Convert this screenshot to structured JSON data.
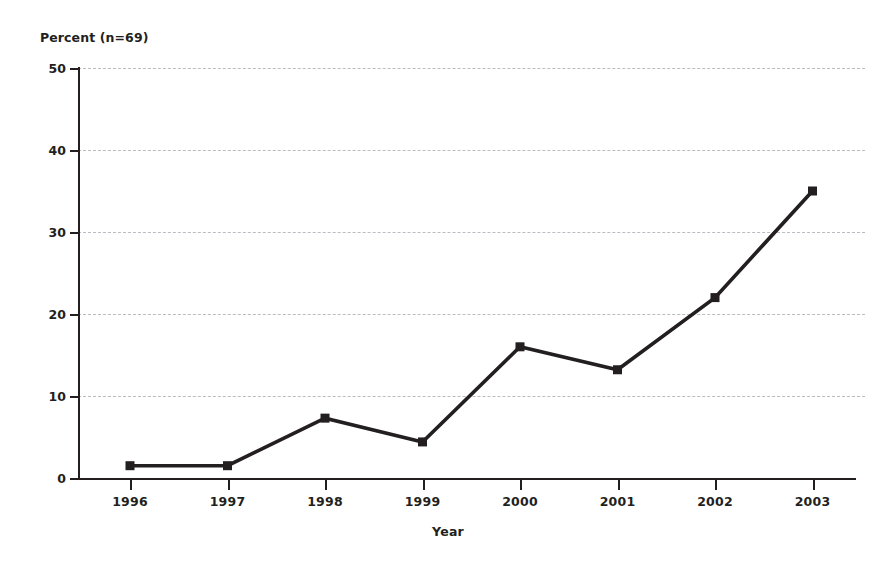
{
  "chart_data": {
    "type": "line",
    "title": "",
    "ylabel": "Percent (n=69)",
    "xlabel": "Year",
    "categories": [
      "1996",
      "1997",
      "1998",
      "1999",
      "2000",
      "2001",
      "2002",
      "2003"
    ],
    "values": [
      1.5,
      1.5,
      7.3,
      4.4,
      16,
      13.2,
      22,
      35
    ],
    "series": [
      {
        "name": "Percent",
        "values": [
          1.5,
          1.5,
          7.3,
          4.4,
          16,
          13.2,
          22,
          35
        ]
      }
    ],
    "ylim": [
      0,
      50
    ],
    "ytick_labels": [
      "0",
      "10",
      "20",
      "30",
      "40",
      "50"
    ],
    "ytick_values": [
      0,
      10,
      20,
      30,
      40,
      50
    ],
    "xtick_labels": [
      "1996",
      "1997",
      "1998",
      "1999",
      "2000",
      "2001",
      "2002",
      "2003"
    ],
    "grid": true,
    "grid_axis": "y",
    "grid_style": "dashed",
    "legend": false,
    "legend_position": "none",
    "marker": "square",
    "colors": {
      "line": "#231f20",
      "marker": "#231f20",
      "axis": "#231f20",
      "grid": "#b9bcc0",
      "background": "#ffffff",
      "text": "#231f20"
    },
    "annotations": []
  }
}
